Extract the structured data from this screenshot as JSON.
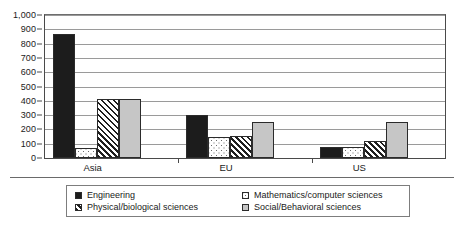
{
  "chart_data": {
    "type": "bar",
    "title": "",
    "subtitle": "",
    "xlabel": "",
    "ylabel": "",
    "categories": [
      "Asia",
      "EU",
      "US"
    ],
    "ylim": [
      0,
      1000
    ],
    "ytick_step": 100,
    "ytick_labels": [
      "0",
      "100",
      "200",
      "300",
      "400",
      "500",
      "600",
      "700",
      "800",
      "900",
      "1,000"
    ],
    "grid": true,
    "legend_position": "bottom",
    "series": [
      {
        "name": "Engineering",
        "pattern": "solid-black",
        "color": "#1c1c1c",
        "values": [
          870,
          300,
          75
        ]
      },
      {
        "name": "Mathematics/computer sciences",
        "pattern": "dotted-white",
        "color": "#ffffff",
        "values": [
          70,
          150,
          75
        ]
      },
      {
        "name": "Physical/biological sciences",
        "pattern": "diagonal-hatch",
        "color": "#ffffff",
        "values": [
          410,
          155,
          120
        ]
      },
      {
        "name": "Social/Behavioral sciences",
        "pattern": "solid-gray",
        "color": "#c6c6c6",
        "values": [
          415,
          250,
          250
        ]
      }
    ]
  },
  "legend": {
    "entries": [
      {
        "label": "Engineering",
        "swatch": "swatch-engineering"
      },
      {
        "label": "Mathematics/computer sciences",
        "swatch": "swatch-math"
      },
      {
        "label": "Physical/biological sciences",
        "swatch": "swatch-physical"
      },
      {
        "label": "Social/Behavioral sciences",
        "swatch": "swatch-social"
      }
    ]
  }
}
